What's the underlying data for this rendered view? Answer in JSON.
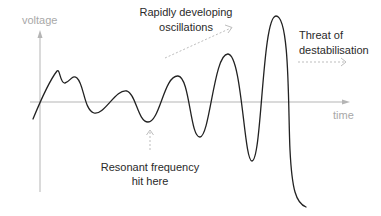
{
  "diagram": {
    "axes": {
      "y_label": "voltage",
      "x_label": "time",
      "axis_color": "#b5b5b5"
    },
    "curve": {
      "color": "#222222",
      "description": "Oscillating voltage waveform with growing amplitude"
    },
    "annotations": {
      "oscillations": {
        "line1": "Rapidly developing",
        "line2": "oscillations"
      },
      "destabilisation": {
        "line1": "Threat of",
        "line2": "destabilisation"
      },
      "resonance": {
        "line1": "Resonant frequency",
        "line2": "hit here"
      }
    },
    "arrow_color": "#bdbdbd",
    "text_color": "#2a2a2a",
    "label_gray": "#a8a8a8"
  }
}
